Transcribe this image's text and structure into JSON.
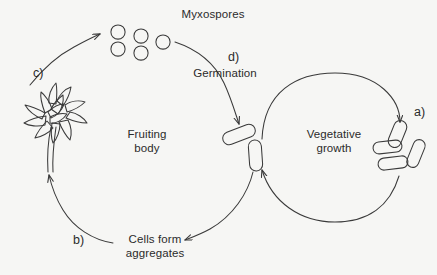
{
  "diagram": {
    "title_text_nodes": {
      "myxospores": "Myxospores",
      "germination": "Germination",
      "fruiting_body": "Fruiting\nbody",
      "vegetative_growth": "Vegetative\ngrowth",
      "cells_form_aggregates": "Cells form\naggregates"
    },
    "step_labels": {
      "a": "a)",
      "b": "b)",
      "c": "c)",
      "d": "d)"
    },
    "colors": {
      "background": "#f6f6f4",
      "ink": "#2b2b2b",
      "stroke": "#3a3a3a"
    },
    "shapes": {
      "myxospores_count": 5,
      "vegetative_rods_right_count": 4,
      "center_rods_count": 2,
      "fruiting_body_petals": 11
    }
  }
}
